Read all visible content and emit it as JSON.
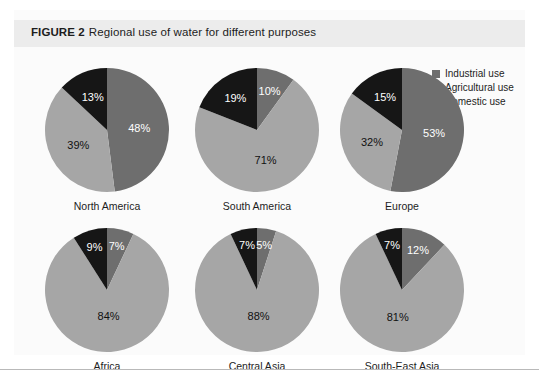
{
  "figure": {
    "label": "FIGURE 2",
    "caption": "Regional use of water for different purposes"
  },
  "legend": {
    "items": [
      {
        "label": "Industrial use",
        "color": "#6e6e6e"
      },
      {
        "label": "Agricultural use",
        "color": "#a6a6a6"
      },
      {
        "label": "Domestic use",
        "color": "#161616"
      }
    ]
  },
  "chart_data": {
    "type": "pie",
    "title": "Regional use of water for different purposes",
    "legend_position": "top-right",
    "value_unit": "percent",
    "start_angle_deg": 0,
    "direction": "clockwise",
    "series_names": [
      "Industrial use",
      "Agricultural use",
      "Domestic use"
    ],
    "colors": [
      "#6e6e6e",
      "#a6a6a6",
      "#161616"
    ],
    "charts": [
      {
        "name": "North America",
        "slices": [
          {
            "label": "Industrial use",
            "value": 48,
            "text": "48%",
            "color": "#6e6e6e"
          },
          {
            "label": "Agricultural use",
            "value": 39,
            "text": "39%",
            "color": "#a6a6a6"
          },
          {
            "label": "Domestic use",
            "value": 13,
            "text": "13%",
            "color": "#161616"
          }
        ]
      },
      {
        "name": "South America",
        "slices": [
          {
            "label": "Industrial use",
            "value": 10,
            "text": "10%",
            "color": "#6e6e6e"
          },
          {
            "label": "Agricultural use",
            "value": 71,
            "text": "71%",
            "color": "#a6a6a6"
          },
          {
            "label": "Domestic use",
            "value": 19,
            "text": "19%",
            "color": "#161616"
          }
        ]
      },
      {
        "name": "Europe",
        "slices": [
          {
            "label": "Industrial use",
            "value": 53,
            "text": "53%",
            "color": "#6e6e6e"
          },
          {
            "label": "Agricultural use",
            "value": 32,
            "text": "32%",
            "color": "#a6a6a6"
          },
          {
            "label": "Domestic use",
            "value": 15,
            "text": "15%",
            "color": "#161616"
          }
        ]
      },
      {
        "name": "Africa",
        "slices": [
          {
            "label": "Industrial use",
            "value": 7,
            "text": "7%",
            "color": "#6e6e6e"
          },
          {
            "label": "Agricultural use",
            "value": 84,
            "text": "84%",
            "color": "#a6a6a6"
          },
          {
            "label": "Domestic use",
            "value": 9,
            "text": "9%",
            "color": "#161616"
          }
        ]
      },
      {
        "name": "Central Asia",
        "slices": [
          {
            "label": "Industrial use",
            "value": 5,
            "text": "5%",
            "color": "#6e6e6e"
          },
          {
            "label": "Agricultural use",
            "value": 88,
            "text": "88%",
            "color": "#a6a6a6"
          },
          {
            "label": "Domestic use",
            "value": 7,
            "text": "7%",
            "color": "#161616"
          }
        ]
      },
      {
        "name": "South-East Asia",
        "slices": [
          {
            "label": "Industrial use",
            "value": 12,
            "text": "12%",
            "color": "#6e6e6e"
          },
          {
            "label": "Agricultural use",
            "value": 81,
            "text": "81%",
            "color": "#a6a6a6"
          },
          {
            "label": "Domestic use",
            "value": 7,
            "text": "7%",
            "color": "#161616"
          }
        ]
      }
    ]
  }
}
